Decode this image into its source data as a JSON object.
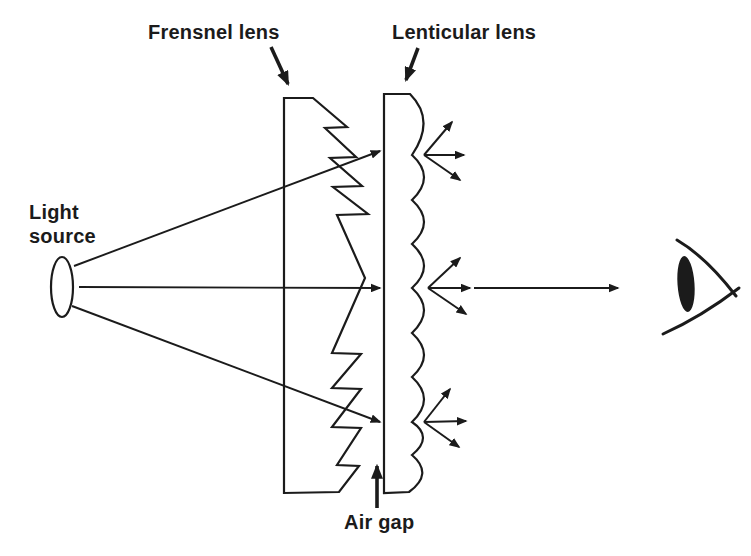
{
  "figure": {
    "labels": {
      "fresnel": "Frensnel lens",
      "lenticular": "Lenticular lens",
      "light_source_line1": "Light",
      "light_source_line2": "source",
      "air_gap": "Air gap"
    },
    "icons": [
      "light-source-ellipse-icon",
      "fresnel-lens-sawtooth-icon",
      "lenticular-lens-scalloped-icon",
      "eye-icon",
      "arrowhead-icon"
    ],
    "colors": {
      "ink": "#1b1b1b",
      "background": "#ffffff"
    }
  }
}
